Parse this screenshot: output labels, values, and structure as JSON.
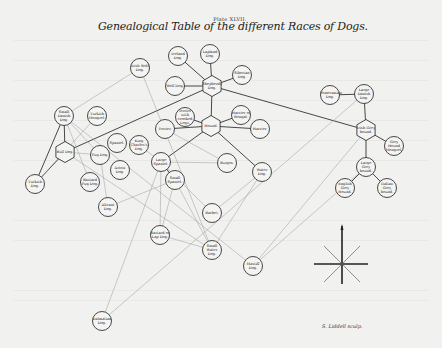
{
  "plate": "Plate XLVII.",
  "title": "Genealogical Table of the different Races of Dogs.",
  "engraver": "S. Liddell sculp.",
  "colors": {
    "paper": "#f1f1ef",
    "ink": "#333333",
    "faint_line": "#9a9a98"
  },
  "nodes": [
    {
      "id": "iceland",
      "label": "Iceland Dog.",
      "shape": "circle",
      "x": 178,
      "y": 56
    },
    {
      "id": "lapland",
      "label": "Lapland Dog.",
      "shape": "circle",
      "x": 210,
      "y": 54
    },
    {
      "id": "siberian",
      "label": "Siberian Dog.",
      "shape": "circle",
      "x": 242,
      "y": 75
    },
    {
      "id": "wolf",
      "label": "Wolf Dog.",
      "shape": "circle",
      "x": 175,
      "y": 86
    },
    {
      "id": "shepherd",
      "label": "Shepherds Dog.",
      "shape": "hex",
      "x": 212,
      "y": 86
    },
    {
      "id": "irish-wolf",
      "label": "Irish Wolf Dog.",
      "shape": "circle",
      "x": 140,
      "y": 68
    },
    {
      "id": "terrier-legs",
      "label": "Terrier with crooked Legs.",
      "shape": "circle",
      "x": 185,
      "y": 117
    },
    {
      "id": "harrier-bengal",
      "label": "Harrier of Bengal.",
      "shape": "circle",
      "x": 241,
      "y": 115
    },
    {
      "id": "hound",
      "label": "Hound.",
      "shape": "hex",
      "x": 211,
      "y": 126
    },
    {
      "id": "terrier",
      "label": "Terrier.",
      "shape": "circle",
      "x": 165,
      "y": 129
    },
    {
      "id": "harrier",
      "label": "Harrier.",
      "shape": "circle",
      "x": 260,
      "y": 129
    },
    {
      "id": "pomeranian",
      "label": "Pomeranian Dog.",
      "shape": "circle",
      "x": 330,
      "y": 95
    },
    {
      "id": "large-danish",
      "label": "Large Danish Dog.",
      "shape": "circle",
      "x": 364,
      "y": 94
    },
    {
      "id": "irish-greyhound",
      "label": "Irish Grey hound.",
      "shape": "hex",
      "x": 366,
      "y": 130
    },
    {
      "id": "grey-mongrel",
      "label": "Grey Hound Mongrel.",
      "shape": "circle",
      "x": 394,
      "y": 146
    },
    {
      "id": "large-greyhound",
      "label": "Large Grey hound.",
      "shape": "circle",
      "x": 366,
      "y": 167
    },
    {
      "id": "english-greyhound",
      "label": "English Grey Hound.",
      "shape": "circle",
      "x": 345,
      "y": 188
    },
    {
      "id": "italian-greyhound",
      "label": "Italian Grey hound.",
      "shape": "circle",
      "x": 387,
      "y": 188
    },
    {
      "id": "small-danish",
      "label": "Small Danish Dog.",
      "shape": "circle",
      "x": 64,
      "y": 116
    },
    {
      "id": "turkish-mongrel",
      "label": "Turkish Mongrel.",
      "shape": "circle",
      "x": 97,
      "y": 116
    },
    {
      "id": "bull",
      "label": "Bull Dog.",
      "shape": "hex",
      "x": 65,
      "y": 152
    },
    {
      "id": "pug",
      "label": "Pug Dog.",
      "shape": "circle",
      "x": 100,
      "y": 155
    },
    {
      "id": "turkish",
      "label": "Turkish Dog.",
      "shape": "circle",
      "x": 35,
      "y": 184
    },
    {
      "id": "bastard-pug",
      "label": "Bastard Pug Dog.",
      "shape": "circle",
      "x": 90,
      "y": 182
    },
    {
      "id": "spaniel-dog",
      "label": "Spaniel.",
      "shape": "circle",
      "x": 117,
      "y": 143
    },
    {
      "id": "king-charles",
      "label": "King Charles's Dog.",
      "shape": "circle",
      "x": 139,
      "y": 145
    },
    {
      "id": "artois",
      "label": "Artois Dog.",
      "shape": "circle",
      "x": 120,
      "y": 170
    },
    {
      "id": "large-spaniel",
      "label": "Large Spaniel.",
      "shape": "circle",
      "x": 161,
      "y": 162
    },
    {
      "id": "burgos",
      "label": "Burgos.",
      "shape": "circle",
      "x": 227,
      "y": 163
    },
    {
      "id": "small-spaniel",
      "label": "Small Spaniel.",
      "shape": "circle",
      "x": 175,
      "y": 180
    },
    {
      "id": "water",
      "label": "Water Dog.",
      "shape": "circle",
      "x": 262,
      "y": 172
    },
    {
      "id": "alicant",
      "label": "Alicant Dog.",
      "shape": "circle",
      "x": 108,
      "y": 207
    },
    {
      "id": "barbet",
      "label": "Barbet.",
      "shape": "circle",
      "x": 212,
      "y": 213
    },
    {
      "id": "bastard-pug-2",
      "label": "Bastard or Lap Dog.",
      "shape": "circle",
      "x": 160,
      "y": 235
    },
    {
      "id": "small-water",
      "label": "Small Water Dog.",
      "shape": "circle",
      "x": 212,
      "y": 250
    },
    {
      "id": "mastiff",
      "label": "Mastiff Dog.",
      "shape": "circle",
      "x": 253,
      "y": 266
    },
    {
      "id": "dalmatian",
      "label": "Dalmatian Dog.",
      "shape": "circle",
      "x": 102,
      "y": 321
    }
  ],
  "edges": [
    [
      "iceland",
      "shepherd",
      "dark"
    ],
    [
      "lapland",
      "shepherd",
      "dark"
    ],
    [
      "siberian",
      "shepherd",
      "dark"
    ],
    [
      "wolf",
      "shepherd",
      "dark"
    ],
    [
      "shepherd",
      "hound",
      "dark"
    ],
    [
      "shepherd",
      "bull",
      "dark"
    ],
    [
      "shepherd",
      "irish-greyhound",
      "dark"
    ],
    [
      "hound",
      "terrier",
      "dark"
    ],
    [
      "hound",
      "harrier",
      "dark"
    ],
    [
      "hound",
      "terrier-legs",
      "dark"
    ],
    [
      "hound",
      "harrier-bengal",
      "dark"
    ],
    [
      "hound",
      "large-spaniel",
      "dark"
    ],
    [
      "hound",
      "water",
      "dark"
    ],
    [
      "pomeranian",
      "large-danish",
      "dark"
    ],
    [
      "large-danish",
      "irish-greyhound",
      "dark"
    ],
    [
      "irish-greyhound",
      "grey-mongrel",
      "dark"
    ],
    [
      "irish-greyhound",
      "large-greyhound",
      "dark"
    ],
    [
      "large-greyhound",
      "english-greyhound",
      "dark"
    ],
    [
      "large-greyhound",
      "italian-greyhound",
      "dark"
    ],
    [
      "small-danish",
      "bull",
      "dark"
    ],
    [
      "small-danish",
      "turkish",
      "dark"
    ],
    [
      "bull",
      "turkish",
      "dark"
    ],
    [
      "large-spaniel",
      "small-spaniel",
      "dark"
    ],
    [
      "irish-wolf",
      "small-danish",
      "faint"
    ],
    [
      "irish-wolf",
      "small-water",
      "faint"
    ],
    [
      "small-danish",
      "pug",
      "faint"
    ],
    [
      "small-danish",
      "bastard-pug",
      "faint"
    ],
    [
      "small-danish",
      "mastiff",
      "faint"
    ],
    [
      "turkish-mongrel",
      "turkish",
      "faint"
    ],
    [
      "bull",
      "pug",
      "faint"
    ],
    [
      "terrier",
      "burgos",
      "faint"
    ],
    [
      "large-spaniel",
      "burgos",
      "faint"
    ],
    [
      "king-charles",
      "large-spaniel",
      "faint"
    ],
    [
      "large-spaniel",
      "barbet",
      "faint"
    ],
    [
      "water",
      "barbet",
      "faint"
    ],
    [
      "water",
      "small-water",
      "faint"
    ],
    [
      "small-spaniel",
      "small-water",
      "faint"
    ],
    [
      "small-spaniel",
      "bastard-pug-2",
      "faint"
    ],
    [
      "large-spaniel",
      "bastard-pug-2",
      "faint"
    ],
    [
      "alicant",
      "small-spaniel",
      "faint"
    ],
    [
      "bastard-pug-2",
      "small-water",
      "faint"
    ],
    [
      "large-spaniel",
      "dalmatian",
      "faint"
    ],
    [
      "irish-greyhound",
      "mastiff",
      "faint"
    ],
    [
      "large-danish",
      "dalmatian",
      "faint"
    ],
    [
      "pug",
      "alicant",
      "faint"
    ],
    [
      "bull",
      "small-water",
      "faint"
    ],
    [
      "large-greyhound",
      "mastiff",
      "faint"
    ]
  ]
}
